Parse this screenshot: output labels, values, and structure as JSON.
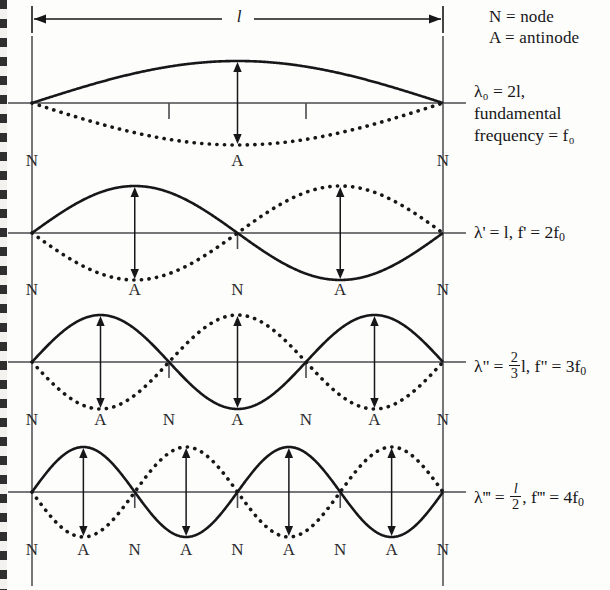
{
  "diagram": {
    "legend": [
      {
        "id": "node",
        "text": "N = node"
      },
      {
        "id": "antinode",
        "text": "A = antinode"
      }
    ],
    "dimension": {
      "label": "l",
      "description": "string length l spanning both fixed ends"
    },
    "colors": {
      "ink": "#17171a",
      "axis": "#4a4a4f",
      "background": "#fdfdfb"
    },
    "modes": [
      {
        "id": "fundamental",
        "harmonic": 1,
        "wavelength_label": "λ",
        "wavelength_sub": "0",
        "wavelength_value": "2l",
        "frequency_label": "fundamental frequency",
        "frequency_value": "f",
        "frequency_sub": "0",
        "label_lines": [
          "λ₀ = 2l,",
          "fundamental",
          "frequency = f₀"
        ],
        "points": [
          "N",
          "A",
          "N"
        ],
        "ticks": 2
      },
      {
        "id": "second-harmonic",
        "harmonic": 2,
        "wavelength_label": "λ'",
        "wavelength_value": "l",
        "frequency_label": "f'",
        "frequency_value": "2f₀",
        "label_text": "λ' = l, f' = 2f₀",
        "points": [
          "N",
          "A",
          "N",
          "A",
          "N"
        ],
        "ticks": 1
      },
      {
        "id": "third-harmonic",
        "harmonic": 3,
        "wavelength_label": "λ\"",
        "wavelength_value": "2/3 l",
        "frequency_label": "f\"",
        "frequency_value": "3f₀",
        "label_text": "λ\" = ⅔l, f\" = 3f₀",
        "points": [
          "N",
          "A",
          "N",
          "A",
          "N",
          "A",
          "N"
        ],
        "ticks": 2
      },
      {
        "id": "fourth-harmonic",
        "harmonic": 4,
        "wavelength_label": "λ'''",
        "wavelength_value": "l/2",
        "frequency_label": "f'''",
        "frequency_value": "4f₀",
        "label_text": "λ''' = l/2, f''' = 4f₀",
        "points": [
          "N",
          "A",
          "N",
          "A",
          "N",
          "A",
          "N",
          "A",
          "N"
        ],
        "ticks": 3
      }
    ]
  },
  "chart_data": {
    "type": "line",
    "xlabel": "position along string",
    "ylabel": "displacement",
    "x_range": [
      0,
      1
    ],
    "grid": false,
    "legend_position": "top-right",
    "legend_entries": [
      "N = node",
      "A = antinode"
    ],
    "annotations": [
      "λ₀ = 2l, fundamental frequency = f₀",
      "λ' = l, f' = 2f₀",
      "λ\" = ⅔l, f\" = 3f₀",
      "λ''' = l/2, f''' = 4f₀"
    ],
    "series": [
      {
        "name": "fundamental (n=1) solid",
        "style": "solid",
        "formula": "sin(pi*x)",
        "half_wavelengths": 1,
        "nodes_x": [
          0,
          1
        ],
        "antinodes_x": [
          0.5
        ]
      },
      {
        "name": "fundamental (n=1) dotted",
        "style": "dotted",
        "formula": "-sin(pi*x)",
        "half_wavelengths": 1
      },
      {
        "name": "second harmonic (n=2) solid",
        "style": "solid",
        "formula": "sin(2*pi*x)",
        "half_wavelengths": 2,
        "nodes_x": [
          0,
          0.5,
          1
        ],
        "antinodes_x": [
          0.25,
          0.75
        ]
      },
      {
        "name": "second harmonic (n=2) dotted",
        "style": "dotted",
        "formula": "-sin(2*pi*x)",
        "half_wavelengths": 2
      },
      {
        "name": "third harmonic (n=3) solid",
        "style": "solid",
        "formula": "sin(3*pi*x)",
        "half_wavelengths": 3,
        "nodes_x": [
          0,
          0.3333,
          0.6667,
          1
        ],
        "antinodes_x": [
          0.1667,
          0.5,
          0.8333
        ]
      },
      {
        "name": "third harmonic (n=3) dotted",
        "style": "dotted",
        "formula": "-sin(3*pi*x)",
        "half_wavelengths": 3
      },
      {
        "name": "fourth harmonic (n=4) solid",
        "style": "solid",
        "formula": "sin(4*pi*x)",
        "half_wavelengths": 4,
        "nodes_x": [
          0,
          0.25,
          0.5,
          0.75,
          1
        ],
        "antinodes_x": [
          0.125,
          0.375,
          0.625,
          0.875
        ]
      },
      {
        "name": "fourth harmonic (n=4) dotted",
        "style": "dotted",
        "formula": "-sin(4*pi*x)",
        "half_wavelengths": 4
      }
    ]
  }
}
